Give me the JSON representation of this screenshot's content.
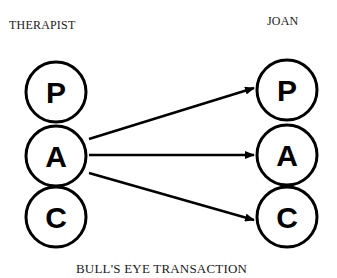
{
  "diagram": {
    "left_label": "THERAPIST",
    "right_label": "JOAN",
    "caption": "BULL'S EYE TRANSACTION",
    "left_states": [
      {
        "letter": "P",
        "cx": 56,
        "cy": 92
      },
      {
        "letter": "A",
        "cx": 56,
        "cy": 156
      },
      {
        "letter": "C",
        "cx": 56,
        "cy": 217
      }
    ],
    "right_states": [
      {
        "letter": "P",
        "cx": 287,
        "cy": 90
      },
      {
        "letter": "A",
        "cx": 287,
        "cy": 155
      },
      {
        "letter": "C",
        "cx": 287,
        "cy": 217
      }
    ],
    "arrows": [
      {
        "from": "THERAPIST.A",
        "to": "JOAN.P"
      },
      {
        "from": "THERAPIST.A",
        "to": "JOAN.A"
      },
      {
        "from": "THERAPIST.A",
        "to": "JOAN.C"
      }
    ],
    "colors": {
      "stroke": "#000000",
      "text": "#1a1a1a",
      "background": "#ffffff"
    }
  }
}
